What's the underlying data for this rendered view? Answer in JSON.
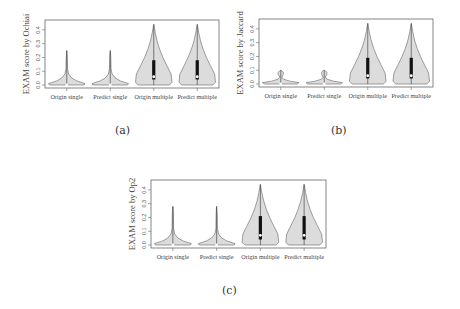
{
  "chart_data": [
    {
      "id": "a",
      "type": "violin",
      "caption": "(a)",
      "title": "",
      "xlabel": "",
      "ylabel": "EXAM score by Ochiai",
      "ylim": [
        0,
        0.45
      ],
      "yticks": [
        "0.0",
        "0.1",
        "0.2",
        "0.3",
        "0.4"
      ],
      "categories": [
        "Origin single",
        "Predict single",
        "Origin multiple",
        "Predict multiple"
      ],
      "series": [
        {
          "name": "Origin single",
          "max": 0.25,
          "median": 0.0,
          "q1": 0.0,
          "q3": 0.01,
          "shape": "single"
        },
        {
          "name": "Predict single",
          "max": 0.25,
          "median": 0.0,
          "q1": 0.0,
          "q3": 0.01,
          "shape": "single"
        },
        {
          "name": "Origin multiple",
          "max": 0.44,
          "median": 0.06,
          "q1": 0.04,
          "q3": 0.18,
          "shape": "multiple"
        },
        {
          "name": "Predict multiple",
          "max": 0.44,
          "median": 0.06,
          "q1": 0.04,
          "q3": 0.18,
          "shape": "multiple"
        }
      ],
      "grid": false
    },
    {
      "id": "b",
      "type": "violin",
      "caption": "(b)",
      "title": "",
      "xlabel": "",
      "ylabel": "EXAM score by Jaccard",
      "ylim": [
        0,
        0.45
      ],
      "yticks": [
        "0.0",
        "0.1",
        "0.2",
        "0.3",
        "0.4"
      ],
      "categories": [
        "Origin single",
        "Predict single",
        "Origin multiple",
        "Predict multiple"
      ],
      "series": [
        {
          "name": "Origin single",
          "max": 0.1,
          "median": 0.0,
          "q1": 0.0,
          "q3": 0.01,
          "shape": "single-bulb"
        },
        {
          "name": "Predict single",
          "max": 0.1,
          "median": 0.0,
          "q1": 0.0,
          "q3": 0.01,
          "shape": "single-bulb"
        },
        {
          "name": "Origin multiple",
          "max": 0.44,
          "median": 0.06,
          "q1": 0.04,
          "q3": 0.19,
          "shape": "multiple"
        },
        {
          "name": "Predict multiple",
          "max": 0.44,
          "median": 0.06,
          "q1": 0.04,
          "q3": 0.19,
          "shape": "multiple"
        }
      ],
      "grid": false
    },
    {
      "id": "c",
      "type": "violin",
      "caption": "(c)",
      "title": "",
      "xlabel": "",
      "ylabel": "EXAM score by Op2",
      "ylim": [
        0,
        0.45
      ],
      "yticks": [
        "0.0",
        "0.1",
        "0.2",
        "0.3",
        "0.4"
      ],
      "categories": [
        "Origin single",
        "Predict single",
        "Origin multiple",
        "Predict multiple"
      ],
      "series": [
        {
          "name": "Origin single",
          "max": 0.28,
          "median": 0.0,
          "q1": 0.0,
          "q3": 0.01,
          "shape": "single"
        },
        {
          "name": "Predict single",
          "max": 0.28,
          "median": 0.0,
          "q1": 0.0,
          "q3": 0.01,
          "shape": "single"
        },
        {
          "name": "Origin multiple",
          "max": 0.44,
          "median": 0.07,
          "q1": 0.04,
          "q3": 0.21,
          "shape": "multiple"
        },
        {
          "name": "Predict multiple",
          "max": 0.44,
          "median": 0.07,
          "q1": 0.04,
          "q3": 0.21,
          "shape": "multiple"
        }
      ],
      "grid": false
    }
  ],
  "colors": {
    "violin_fill": "#dcdcdc",
    "violin_stroke": "#777777",
    "box": "#111111",
    "median": "#ffffff",
    "axis": "#666666"
  }
}
